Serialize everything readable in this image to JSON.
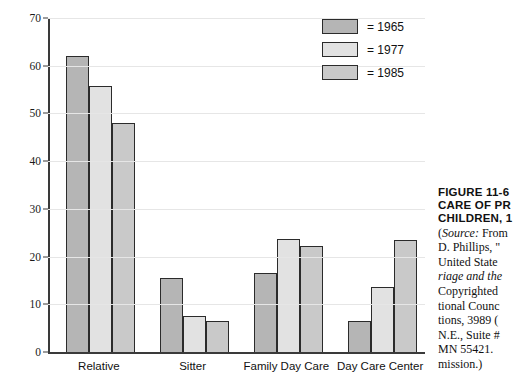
{
  "chart_data": {
    "type": "bar",
    "title": "",
    "xlabel": "",
    "ylabel": "",
    "ylim": [
      0,
      70
    ],
    "yticks": [
      0,
      10,
      20,
      30,
      40,
      50,
      60,
      70
    ],
    "grid": true,
    "legend_position": "top-right",
    "categories": [
      "Relative",
      "Sitter",
      "Family Day Care",
      "Day Care Center"
    ],
    "series": [
      {
        "name": "1965",
        "color": "#b5b5b5",
        "values": [
          62.0,
          15.5,
          16.6,
          6.6
        ]
      },
      {
        "name": "1977",
        "color": "#e2e2e2",
        "values": [
          55.8,
          7.5,
          23.6,
          13.7
        ]
      },
      {
        "name": "1985",
        "color": "#c9c9c9",
        "values": [
          48.0,
          6.5,
          22.3,
          23.5
        ]
      }
    ]
  },
  "legend": {
    "items": [
      {
        "label": "= 1965",
        "swatch": "s0"
      },
      {
        "label": "= 1977",
        "swatch": "s1"
      },
      {
        "label": "= 1985",
        "swatch": "s2"
      }
    ]
  },
  "caption": {
    "title_lines": [
      "FIGURE 11-6",
      "CARE OF PR",
      "CHILDREN, 1"
    ],
    "body_lines": [
      {
        "text": "(Source: From",
        "italic_prefix": "Source:"
      },
      {
        "text": "D. Phillips, \"",
        "italic_prefix": ""
      },
      {
        "text": "United State",
        "italic_prefix": ""
      },
      {
        "text": "riage and the",
        "italic_prefix": "ALL"
      },
      {
        "text": "Copyrighted",
        "italic_prefix": ""
      },
      {
        "text": "tional Counc",
        "italic_prefix": ""
      },
      {
        "text": "tions, 3989 (",
        "italic_prefix": ""
      },
      {
        "text": "N.E., Suite #",
        "italic_prefix": ""
      },
      {
        "text": "MN 55421. ",
        "italic_prefix": ""
      },
      {
        "text": "mission.)",
        "italic_prefix": ""
      }
    ]
  }
}
